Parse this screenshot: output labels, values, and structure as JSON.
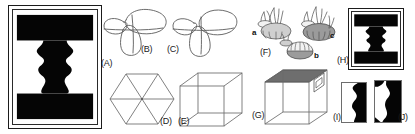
{
  "figure": {
    "background_color": "#ffffff",
    "width": 415,
    "height": 134
  },
  "labels": {
    "a": "(A)",
    "b": "(B)",
    "c": "(C)",
    "d": "(D)",
    "e": "(E)",
    "f": "(F)",
    "g": "(G)",
    "h": "(H)",
    "i": "(I)",
    "j": "(J)"
  },
  "panels": [
    {
      "id": "A",
      "label": "(A)",
      "name": "rubin-vase-large",
      "description": "Framed black-and-white Rubin face-vase figure",
      "colors": {
        "silhouette": "#050505",
        "ground": "#ffffff",
        "frame": "#1b1b1b"
      }
    },
    {
      "id": "B",
      "label": "(B)",
      "name": "trefoil-knot-b",
      "description": "Open line drawing of a three-lobed self-crossing curve",
      "colors": {
        "stroke": "#5b5b5b"
      }
    },
    {
      "id": "C",
      "label": "(C)",
      "name": "trefoil-knot-c",
      "description": "Second three-lobed self-crossing curve with an open gap",
      "colors": {
        "stroke": "#5b5b5b"
      }
    },
    {
      "id": "D",
      "label": "(D)",
      "name": "hexagon-with-diagonals",
      "description": "Regular hexagon divided into six triangles by three long diagonals",
      "colors": {
        "stroke": "#6a6a6a"
      }
    },
    {
      "id": "E",
      "label": "(E)",
      "name": "necker-cube-wireframe",
      "description": "Transparent wireframe Necker cube",
      "colors": {
        "stroke": "#6a6a6a"
      }
    },
    {
      "id": "F",
      "label": "(F)",
      "name": "mushroom-cluster",
      "description": "Shaded drawings of three mushroom caps with rootlets",
      "sublabels": [
        "a",
        "b",
        "c"
      ],
      "colors": {
        "cap_light": "#f2f2f2",
        "cap_mid": "#cfcfcf",
        "cap_dark": "#9b9b9b",
        "stroke": "#4a4a4a"
      }
    },
    {
      "id": "G",
      "label": "(G)",
      "name": "shaded-cube-with-window",
      "description": "Cube with dark shaded top-rear face and a small parallelogram window on the right face",
      "colors": {
        "stroke": "#6a6a6a",
        "shade": "#6e6e6e"
      }
    },
    {
      "id": "H",
      "label": "(H)",
      "name": "rubin-vase-small",
      "description": "Small framed copy of the Rubin face-vase figure",
      "colors": {
        "silhouette": "#050505",
        "ground": "#ffffff",
        "frame": "#1b1b1b"
      }
    },
    {
      "id": "I",
      "label": "(I)",
      "name": "vase-fragment-left",
      "description": "Cropped left half of the face-vase figure",
      "colors": {
        "silhouette": "#050505",
        "ground": "#ffffff",
        "frame": "#6d6d6d"
      }
    },
    {
      "id": "J",
      "label": "(J)",
      "name": "vase-fragment-right",
      "description": "Cropped right half of the face-vase figure",
      "colors": {
        "silhouette": "#050505",
        "ground": "#ffffff",
        "frame": "#6d6d6d"
      }
    }
  ],
  "sublabels": {
    "f_a": "a",
    "f_b": "b",
    "f_c": "c"
  }
}
